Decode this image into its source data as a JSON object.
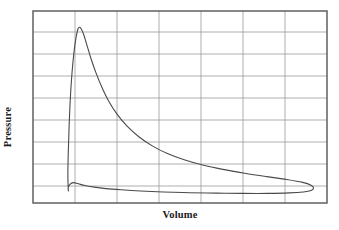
{
  "figure": {
    "width": 339,
    "height": 230,
    "background_color": "#ffffff"
  },
  "axes": {
    "x_title": "Volume",
    "y_title": "Pressure",
    "frame_color": "#555555",
    "grid_color": "#9a9a9a",
    "curve_color": "#4a4a4a",
    "plot_left": 33,
    "plot_top": 11,
    "plot_right": 327,
    "plot_bottom": 203
  },
  "chart_data": {
    "type": "line",
    "title": "",
    "subtitle": "",
    "xlabel": "Volume",
    "ylabel": "Pressure",
    "xlim": [
      0,
      7
    ],
    "ylim": [
      0,
      8
    ],
    "xticks": [
      0,
      1,
      2,
      3,
      4,
      5,
      6,
      7
    ],
    "yticks": [
      0,
      1,
      2,
      3,
      4,
      5,
      6,
      7,
      8
    ],
    "xticklabels": [],
    "yticklabels": [],
    "grid": true,
    "legend": null,
    "legend_position": "none",
    "annotations": [],
    "series": [
      {
        "name": "indicator-loop",
        "closed": true,
        "description": "Closed pressure-volume indicator loop: steep compression rise to peak pressure at low volume, hyperbolic expansion decay, low-pressure return stroke closing at a rounded right tip.",
        "points": [
          [
            0.84,
            0.55
          ],
          [
            0.83,
            1.2
          ],
          [
            0.84,
            2.1
          ],
          [
            0.86,
            3.2
          ],
          [
            0.89,
            4.4
          ],
          [
            0.93,
            5.45
          ],
          [
            0.98,
            6.35
          ],
          [
            1.03,
            6.95
          ],
          [
            1.07,
            7.25
          ],
          [
            1.1,
            7.32
          ],
          [
            1.14,
            7.28
          ],
          [
            1.2,
            7.05
          ],
          [
            1.28,
            6.6
          ],
          [
            1.38,
            6.02
          ],
          [
            1.5,
            5.42
          ],
          [
            1.64,
            4.82
          ],
          [
            1.8,
            4.25
          ],
          [
            2.0,
            3.7
          ],
          [
            2.24,
            3.2
          ],
          [
            2.52,
            2.76
          ],
          [
            2.84,
            2.38
          ],
          [
            3.2,
            2.06
          ],
          [
            3.6,
            1.8
          ],
          [
            4.04,
            1.58
          ],
          [
            4.52,
            1.4
          ],
          [
            5.04,
            1.24
          ],
          [
            5.56,
            1.1
          ],
          [
            6.04,
            0.98
          ],
          [
            6.42,
            0.86
          ],
          [
            6.62,
            0.74
          ],
          [
            6.68,
            0.62
          ],
          [
            6.62,
            0.52
          ],
          [
            6.44,
            0.46
          ],
          [
            6.1,
            0.42
          ],
          [
            5.6,
            0.4
          ],
          [
            5.0,
            0.4
          ],
          [
            4.36,
            0.41
          ],
          [
            3.72,
            0.43
          ],
          [
            3.1,
            0.46
          ],
          [
            2.56,
            0.5
          ],
          [
            2.1,
            0.55
          ],
          [
            1.74,
            0.6
          ],
          [
            1.46,
            0.66
          ],
          [
            1.24,
            0.73
          ],
          [
            1.08,
            0.8
          ],
          [
            0.96,
            0.85
          ],
          [
            0.88,
            0.78
          ],
          [
            0.84,
            0.65
          ],
          [
            0.84,
            0.55
          ]
        ]
      }
    ]
  }
}
